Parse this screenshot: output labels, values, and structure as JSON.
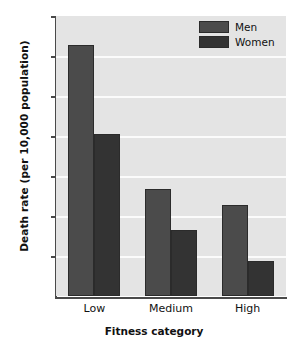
{
  "chart_data": {
    "type": "bar",
    "title": "",
    "xlabel": "Fitness category",
    "ylabel": "Death rate (per 10,000 population)",
    "categories": [
      "Low",
      "Medium",
      "High"
    ],
    "series": [
      {
        "name": "Men",
        "values": [
          62.7,
          26.7,
          22.7
        ],
        "color": "#4b4b4b"
      },
      {
        "name": "Women",
        "values": [
          40.5,
          16.6,
          8.8
        ],
        "color": "#333333"
      }
    ],
    "ylim": [
      0,
      70
    ],
    "yticks": [
      10,
      20,
      30,
      40,
      50,
      60,
      70
    ],
    "ytick_labels": [
      "10",
      "20",
      "30",
      "40",
      "50",
      "60",
      "70"
    ],
    "grid": "horizontal-white",
    "legend_position": "top-right",
    "plot_background": "#e4e4e4",
    "axis_color": "#4a4a4a"
  },
  "legend": {
    "items": [
      {
        "label": "Men"
      },
      {
        "label": "Women"
      }
    ]
  }
}
